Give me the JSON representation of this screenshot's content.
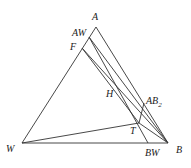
{
  "diagram": {
    "type": "ternary-phase-diagram",
    "points": {
      "A": {
        "label": "A",
        "x": 96,
        "y": 27
      },
      "W": {
        "label": "W",
        "x": 22,
        "y": 143
      },
      "B": {
        "label": "B",
        "x": 168,
        "y": 143
      },
      "AW": {
        "label": "AW",
        "x": 89,
        "y": 37
      },
      "F": {
        "label": "F",
        "x": 82,
        "y": 48
      },
      "BW": {
        "label": "BW",
        "x": 148,
        "y": 143
      },
      "T": {
        "label": "T",
        "x": 139,
        "y": 123
      },
      "AB2": {
        "label": "AB",
        "sub": "2",
        "x": 144,
        "y": 103
      },
      "H": {
        "label": "H",
        "x": 119,
        "y": 95
      }
    }
  }
}
